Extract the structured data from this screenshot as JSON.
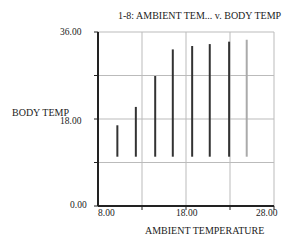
{
  "chart_data": {
    "type": "bar",
    "subtype": "range-bars (vertical lines)",
    "title": "1-8: AMBIENT TEM... v. BODY TEMP",
    "xlabel": "AMBIENT TEMPERATURE",
    "ylabel": "BODY TEMP",
    "xlim": [
      8.0,
      28.0
    ],
    "ylim": [
      0.0,
      36.0
    ],
    "xticks": [
      "8.00",
      "18.00",
      "28.00"
    ],
    "yticks": [
      "0.00",
      "18.00",
      "36.00"
    ],
    "grid": true,
    "legend": null,
    "series": [
      {
        "name": "BODY TEMP",
        "x": [
          10.2,
          12.3,
          14.5,
          16.5,
          18.7,
          20.7,
          22.9,
          24.9
        ],
        "low": [
          10.2,
          10.2,
          10.2,
          10.2,
          10.2,
          10.2,
          10.2,
          10.2
        ],
        "high": [
          16.7,
          20.5,
          26.9,
          32.4,
          33.1,
          33.5,
          34.0,
          34.4
        ],
        "colors": [
          "#333333",
          "#333333",
          "#333333",
          "#333333",
          "#333333",
          "#333333",
          "#333333",
          "#aaaaaa"
        ]
      }
    ]
  },
  "labels": {
    "title": "1-8: AMBIENT TEM... v. BODY TEMP",
    "xlabel": "AMBIENT TEMPERATURE",
    "ylabel": "BODY TEMP",
    "y_top": "36.00",
    "y_mid": "18.00",
    "y_bottom": "0.00",
    "x_left": "8.00",
    "x_mid": "18.00",
    "x_right": "28.00"
  }
}
